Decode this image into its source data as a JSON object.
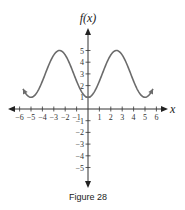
{
  "chart_data": {
    "type": "line",
    "title": "",
    "caption": "Figure 28",
    "xlabel": "x",
    "ylabel": "f(x)",
    "xlim": [
      -6.5,
      6.5
    ],
    "ylim": [
      -6.5,
      6.5
    ],
    "x_ticks": [
      -6,
      -5,
      -4,
      -3,
      -2,
      -1,
      1,
      2,
      3,
      4,
      5,
      6
    ],
    "y_ticks": [
      -5,
      -4,
      -3,
      -2,
      -1,
      1,
      2,
      3,
      4,
      5
    ],
    "x_tick_labels": [
      "−6",
      "−5",
      "−4",
      "−3",
      "−2",
      "−1",
      "1",
      "2",
      "3",
      "4",
      "5",
      "6"
    ],
    "y_tick_labels": [
      "−5",
      "−4",
      "−3",
      "−2",
      "−1",
      "1",
      "2",
      "3",
      "4",
      "5"
    ],
    "grid": false,
    "series": [
      {
        "name": "f(x)",
        "function": "3 - 2cos(2πx/5)",
        "x_range": [
          -5.7,
          5.7
        ],
        "key_points": [
          {
            "x": -5,
            "y": 1
          },
          {
            "x": -2.5,
            "y": 5
          },
          {
            "x": 0,
            "y": 1
          },
          {
            "x": 2.5,
            "y": 5
          },
          {
            "x": 5,
            "y": 1
          }
        ],
        "arrows_at_ends": true,
        "color": "#6b6b6b"
      }
    ]
  }
}
